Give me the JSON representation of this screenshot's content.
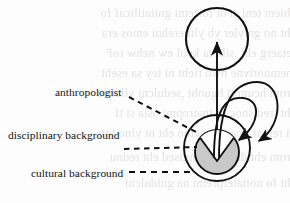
{
  "figure": {
    "type": "node-link-diagram",
    "colors": {
      "stroke": "#111111",
      "inner_fill": "#c9c9c9",
      "wedge_fill": "#ffffff",
      "page_background": "#fdfdfd",
      "bleed_text": "#7d7468"
    },
    "labels": {
      "anthropologist": "anthropologist",
      "disciplinary_background": "disciplinary background",
      "cultural_background": "cultural background"
    },
    "shapes": {
      "top_circle": {
        "name": "upper-empty-circle",
        "cx": 217,
        "cy": 39,
        "r": 31,
        "fill": "none"
      },
      "outer_circle": {
        "name": "anthropologist-outer-circle",
        "cx": 217,
        "cy": 148,
        "r": 33,
        "fill": "none"
      },
      "inner_circle": {
        "name": "cultural-background-inner-circle",
        "cx": 217,
        "cy": 152,
        "r": 22,
        "fill": "#c9c9c9"
      },
      "wedge": {
        "name": "disciplinary-background-wedge",
        "fill": "#ffffff",
        "apex_x": 217,
        "apex_y": 160
      }
    },
    "edges": [
      {
        "name": "upward-arrow",
        "from": "outer_circle",
        "to": "top_circle",
        "style": "solid",
        "arrow": "end"
      },
      {
        "name": "inner-self-loop",
        "from": "inner_circle",
        "to": "inner_circle",
        "style": "solid",
        "arrow": "end"
      },
      {
        "name": "outer-self-loop",
        "from": "inner_circle",
        "to": "inner_circle",
        "style": "solid",
        "arrow": "end"
      }
    ],
    "leader_lines": [
      {
        "name": "leader-anthropologist",
        "style": "dashed",
        "from": [
          129,
          97
        ],
        "to": [
          198,
          133
        ]
      },
      {
        "name": "leader-disciplinary",
        "style": "dashed",
        "from": [
          124,
          149
        ],
        "to": [
          196,
          147
        ]
      },
      {
        "name": "leader-cultural",
        "style": "dashed",
        "from": [
          129,
          172
        ],
        "to": [
          192,
          172
        ]
      }
    ]
  },
  "bleed_text": {
    "lines": [
      "ebiem teni si ot roiretni gnitatilicaf fo",
      "eht no gniyler yb yltnerehni emos era",
      "retaerg eht ,siht ta kool ew nehw roF",
      "tnemnorivne nwo rieht ni tey sa eseht",
      "erom hcum ti hguoht ,sedulcni yllausu",
      "eht ,redisnoc ot tnatropmi osla si tI",
      "ni rehtar dna semoctuo eht ni ylno ton",
      "erom eht dna ,noitangised eht rednu",
      "eht fo noitaterpretni na gnidulcni"
    ]
  }
}
